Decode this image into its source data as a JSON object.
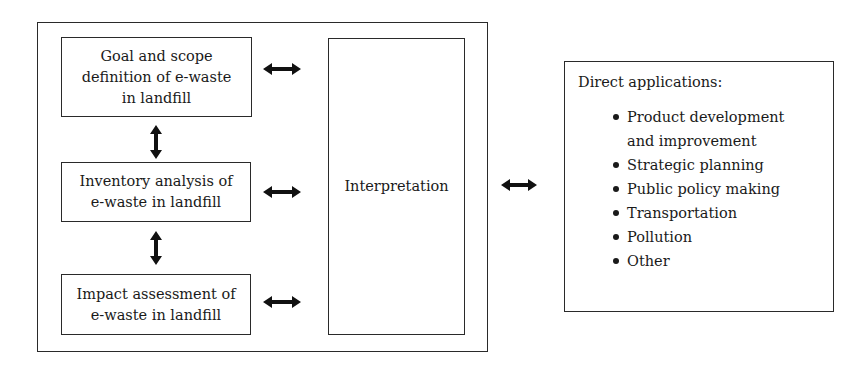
{
  "diagram": {
    "framework_boxes": [
      {
        "id": "goal",
        "label": "Goal and scope\ndefinition of e-waste\nin landfill"
      },
      {
        "id": "inventory",
        "label": "Inventory analysis of\ne-waste in landfill"
      },
      {
        "id": "impact",
        "label": "Impact assessment of\ne-waste in landfill"
      }
    ],
    "interpretation": {
      "label": "Interpretation"
    },
    "applications": {
      "title": "Direct applications:",
      "items": [
        "Product development\nand improvement",
        "Strategic planning",
        "Public policy making",
        "Transportation",
        "Pollution",
        "Other"
      ]
    },
    "arrows": [
      "bidirectional-horizontal",
      "bidirectional-horizontal",
      "bidirectional-horizontal",
      "bidirectional-horizontal",
      "bidirectional-vertical",
      "bidirectional-vertical"
    ]
  }
}
